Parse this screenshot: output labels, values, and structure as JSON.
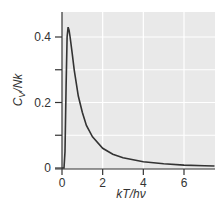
{
  "chart_data": {
    "type": "line",
    "title": "",
    "xlabel": "kT/hν",
    "ylabel": "C_V/Nk",
    "xlim": [
      0,
      7.5
    ],
    "ylim": [
      0,
      0.46
    ],
    "grid": true,
    "legend": null,
    "x_ticks": [
      "0",
      "2",
      "4",
      "6"
    ],
    "y_ticks": [
      "0",
      "0.2",
      "0.4"
    ],
    "series": [
      {
        "name": "C_V/Nk",
        "x": [
          0,
          0.1,
          0.15,
          0.2,
          0.25,
          0.3,
          0.35,
          0.4,
          0.5,
          0.6,
          0.8,
          1.0,
          1.2,
          1.5,
          2.0,
          2.5,
          3.0,
          4.0,
          5.0,
          6.0,
          7.0,
          7.5
        ],
        "values": [
          0,
          0.0,
          0.05,
          0.25,
          0.4,
          0.43,
          0.42,
          0.4,
          0.35,
          0.3,
          0.22,
          0.17,
          0.13,
          0.095,
          0.06,
          0.042,
          0.031,
          0.019,
          0.013,
          0.009,
          0.007,
          0.006
        ]
      }
    ]
  }
}
